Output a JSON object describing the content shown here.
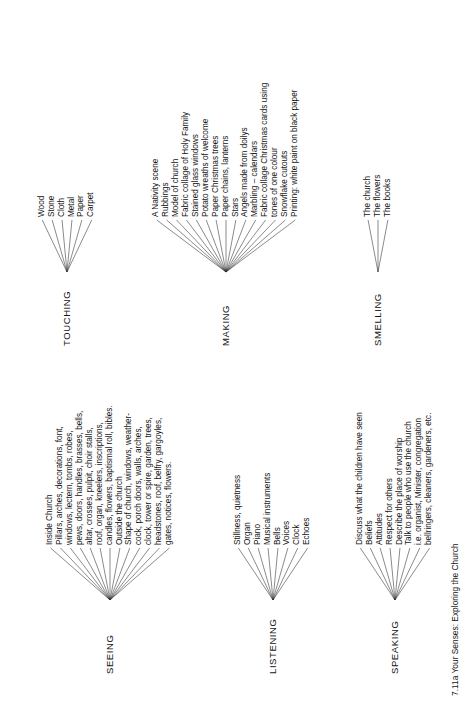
{
  "caption": "7.11a Your Senses: Exploring the Church",
  "groups": [
    {
      "id": "seeing",
      "root": "SEEING",
      "leaves": [
        "Inside Church",
        "Pillars, arches, decorations, font,",
        "windows, lectern, tombs, robes,",
        "pews, doors, handles, brasses, bells,",
        "altar, crosses, pulpit, choir stalls,",
        "roof, organ, kneelers, inscriptions,",
        "candles, flowers, baptismal roll, bibles.",
        "Outside the church",
        "Shape of church, windows, weather-",
        "cock, porch doors, walls, arches,",
        "clock, tower or spire, garden, trees,",
        "headstones, roof, belfry, gargoyles,",
        "gates, notices, flowers."
      ]
    },
    {
      "id": "listening",
      "root": "LISTENING",
      "leaves": [
        "Stillness, quietness",
        "Organ",
        "Piano",
        "Musical instruments",
        "Bells",
        "Voices",
        "Clock",
        "Echoes"
      ]
    },
    {
      "id": "speaking",
      "root": "SPEAKING",
      "leaves": [
        "Discuss what the children have seen",
        "Beliefs",
        "Attitudes",
        "Respect for others",
        "Describe the place of worship",
        "Talk to people who use the church",
        "i.e. organist, Minister, congregation",
        "bellringers, cleaners, gardeners, etc."
      ]
    },
    {
      "id": "touching",
      "root": "TOUCHING",
      "leaves": [
        "Wood",
        "Stone",
        "Cloth",
        "Metal",
        "Paper",
        "Carpet"
      ]
    },
    {
      "id": "making",
      "root": "MAKING",
      "leaves": [
        "A Nativity scene",
        "Rubbings",
        "Model of church",
        "Fabric collage of Holy Family",
        "Stained glass windows",
        "Potato wreaths of welcome",
        "Paper Christmas trees",
        "Paper chains, lanterns",
        "Stars",
        "Angels made from doilys",
        "Marbling – calendars",
        "Fabric collage Christmas cards using",
        "tones of one colour",
        "Snowflake cutouts",
        "Printing: white paint on black paper"
      ]
    },
    {
      "id": "smelling",
      "root": "SMELLING",
      "leaves": [
        "The church",
        "The flowers",
        "The books"
      ]
    }
  ],
  "colors": {
    "ink": "#141414",
    "line": "#2b2b2b",
    "background": "#ffffff"
  }
}
